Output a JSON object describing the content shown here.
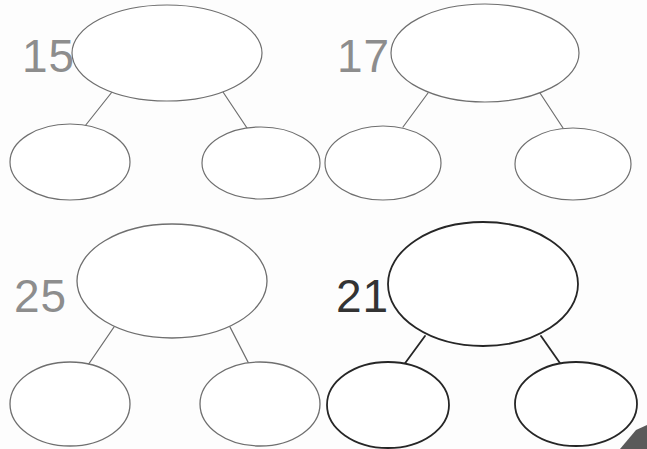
{
  "page": {
    "background_color": "#fdfdfd",
    "width": 647,
    "height": 449
  },
  "style": {
    "ink_light": "#6f6f6f",
    "ink_medium": "#4a4a4a",
    "ink_dark": "#262626",
    "label_light": "#8d8d8d",
    "label_dark": "#333333",
    "fill": "#ffffff",
    "corner_wedge_color": "#5a5a5a"
  },
  "bonds": [
    {
      "id": "bond-15",
      "label": "15",
      "label_color": "#8d8d8d",
      "stroke_color": "#6f6f6f",
      "stroke_width": 1.2,
      "label_x": 22,
      "label_y": 72,
      "label_size": 46,
      "parent": {
        "cx": 167,
        "cy": 53,
        "rx": 95,
        "ry": 48
      },
      "left_child": {
        "cx": 70,
        "cy": 162,
        "rx": 60,
        "ry": 38
      },
      "right_child": {
        "cx": 261,
        "cy": 163,
        "rx": 59,
        "ry": 36
      },
      "left_link": {
        "x1": 112,
        "y1": 92,
        "x2": 85,
        "y2": 126
      },
      "right_link": {
        "x1": 223,
        "y1": 92,
        "x2": 247,
        "y2": 128
      }
    },
    {
      "id": "bond-17",
      "label": "17",
      "label_color": "#8d8d8d",
      "stroke_color": "#6f6f6f",
      "stroke_width": 1.2,
      "label_x": 337,
      "label_y": 72,
      "label_size": 46,
      "parent": {
        "cx": 485,
        "cy": 53,
        "rx": 94,
        "ry": 49
      },
      "left_child": {
        "cx": 383,
        "cy": 163,
        "rx": 58,
        "ry": 37
      },
      "right_child": {
        "cx": 573,
        "cy": 164,
        "rx": 58,
        "ry": 36
      },
      "left_link": {
        "x1": 428,
        "y1": 93,
        "x2": 403,
        "y2": 127
      },
      "right_link": {
        "x1": 540,
        "y1": 93,
        "x2": 563,
        "y2": 128
      }
    },
    {
      "id": "bond-25",
      "label": "25",
      "label_color": "#8d8d8d",
      "stroke_color": "#6f6f6f",
      "stroke_width": 1.3,
      "label_x": 14,
      "label_y": 312,
      "label_size": 46,
      "parent": {
        "cx": 172,
        "cy": 281,
        "rx": 95,
        "ry": 57
      },
      "left_child": {
        "cx": 70,
        "cy": 404,
        "rx": 60,
        "ry": 42
      },
      "right_child": {
        "cx": 260,
        "cy": 404,
        "rx": 60,
        "ry": 42
      },
      "left_link": {
        "x1": 114,
        "y1": 327,
        "x2": 88,
        "y2": 365
      },
      "right_link": {
        "x1": 230,
        "y1": 327,
        "x2": 249,
        "y2": 364
      }
    },
    {
      "id": "bond-21",
      "label": "21",
      "label_color": "#333333",
      "stroke_color": "#262626",
      "stroke_width": 1.8,
      "label_x": 336,
      "label_y": 312,
      "label_size": 46,
      "parent": {
        "cx": 483,
        "cy": 284,
        "rx": 95,
        "ry": 62
      },
      "left_child": {
        "cx": 388,
        "cy": 405,
        "rx": 61,
        "ry": 43
      },
      "right_child": {
        "cx": 576,
        "cy": 404,
        "rx": 61,
        "ry": 42
      },
      "left_link": {
        "x1": 425,
        "y1": 336,
        "x2": 403,
        "y2": 366
      },
      "right_link": {
        "x1": 541,
        "y1": 336,
        "x2": 562,
        "y2": 366
      }
    }
  ],
  "corner_mark": {
    "name": "page-corner-wedge",
    "points": "636,430 647,425 647,449 620,449"
  }
}
